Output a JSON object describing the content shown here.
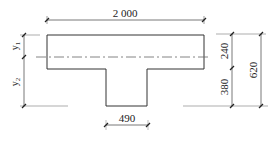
{
  "diagram": {
    "type": "T-section cross-section with dimensions",
    "dimensions": {
      "flange_width": "2 000",
      "web_width": "490",
      "upper_height": "240",
      "lower_height": "380",
      "total_height": "620"
    },
    "labels": {
      "y1": "y",
      "y1_sub": "1",
      "y2": "y",
      "y2_sub": "2"
    },
    "colors": {
      "outline": "#333333",
      "dim_line": "#555555",
      "axis_line": "#666666"
    }
  }
}
